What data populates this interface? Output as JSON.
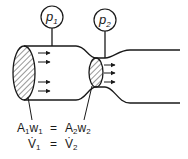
{
  "diagram": {
    "gauges": [
      {
        "id": "p1",
        "label": "p",
        "subscript": "1"
      },
      {
        "id": "p2",
        "label": "p",
        "subscript": "2"
      }
    ],
    "equations": [
      {
        "lhs": {
          "a": "A",
          "a_sub": "1",
          "b": "w",
          "b_sub": "1"
        },
        "op": "=",
        "rhs": {
          "a": "A",
          "a_sub": "2",
          "b": "w",
          "b_sub": "2"
        }
      },
      {
        "lhs": {
          "a": "V̇",
          "a_sub": "1"
        },
        "op": "=",
        "rhs": {
          "a": "V̇",
          "a_sub": "2"
        }
      }
    ],
    "colors": {
      "ink": "#1a1a1a",
      "background": "#ffffff"
    }
  }
}
